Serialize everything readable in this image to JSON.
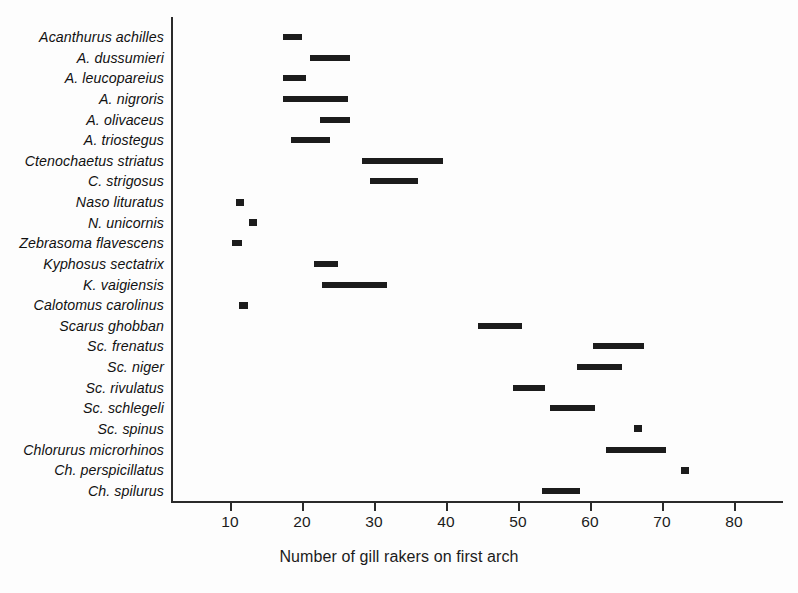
{
  "chart_data": {
    "type": "bar",
    "orientation": "horizontal",
    "title": "",
    "xlabel": "Number of gill rakers on first arch",
    "ylabel": "",
    "xlim": [
      6.5,
      86
    ],
    "xticks": [
      10,
      20,
      30,
      40,
      50,
      60,
      70,
      80
    ],
    "xtick_labels": [
      "10",
      "20",
      "30",
      "40",
      "50",
      "60",
      "70",
      "80"
    ],
    "grid": false,
    "legend": false,
    "bar_color": "#1c1c1c",
    "value_type": "range",
    "categories": [
      "Acanthurus achilles",
      "A. dussumieri",
      "A. leucopareius",
      "A. nigroris",
      "A. olivaceus",
      "A. triostegus",
      "Ctenochaetus striatus",
      "C. strigosus",
      "Naso lituratus",
      "N. unicornis",
      "Zebrasoma flavescens",
      "Kyphosus sectatrix",
      "K. vaigiensis",
      "Calotomus carolinus",
      "Scarus ghobban",
      "Sc. frenatus",
      "Sc. niger",
      "Sc. rivulatus",
      "Sc. schlegeli",
      "Sc. spinus",
      "Chlorurus microrhinos",
      "Ch. perspicillatus",
      "Ch. spilurus"
    ],
    "ranges": [
      {
        "species": "Acanthurus achilles",
        "min": 17.3,
        "max": 20.0
      },
      {
        "species": "A. dussumieri",
        "min": 21.1,
        "max": 26.7
      },
      {
        "species": "A. leucopareius",
        "min": 17.4,
        "max": 20.6
      },
      {
        "species": "A. nigroris",
        "min": 17.4,
        "max": 26.4
      },
      {
        "species": "A. olivaceus",
        "min": 22.5,
        "max": 26.7
      },
      {
        "species": "A. triostegus",
        "min": 18.5,
        "max": 23.9
      },
      {
        "species": "Ctenochaetus striatus",
        "min": 28.3,
        "max": 39.6
      },
      {
        "species": "C. strigosus",
        "min": 29.4,
        "max": 36.1
      },
      {
        "species": "Naso lituratus",
        "min": 10.8,
        "max": 11.9
      },
      {
        "species": "N. unicornis",
        "min": 12.6,
        "max": 13.8
      },
      {
        "species": "Zebrasoma flavescens",
        "min": 10.3,
        "max": 11.7
      },
      {
        "species": "Kyphosus sectatrix",
        "min": 21.7,
        "max": 25.0
      },
      {
        "species": "K. vaigiensis",
        "min": 22.8,
        "max": 31.8
      },
      {
        "species": "Calotomus carolinus",
        "min": 11.2,
        "max": 12.5
      },
      {
        "species": "Scarus ghobban",
        "min": 44.4,
        "max": 50.5
      },
      {
        "species": "Sc. frenatus",
        "min": 60.4,
        "max": 67.5
      },
      {
        "species": "Sc. niger",
        "min": 58.2,
        "max": 64.4
      },
      {
        "species": "Sc. rivulatus",
        "min": 49.3,
        "max": 53.8
      },
      {
        "species": "Sc. schlegeli",
        "min": 54.4,
        "max": 60.7
      },
      {
        "species": "Sc. spinus",
        "min": 66.1,
        "max": 67.2
      },
      {
        "species": "Chlorurus microrhinos",
        "min": 62.2,
        "max": 70.6
      },
      {
        "species": "Ch. perspicillatus",
        "min": 72.6,
        "max": 73.8
      },
      {
        "species": "Ch. spilurus",
        "min": 53.3,
        "max": 58.6
      }
    ]
  }
}
